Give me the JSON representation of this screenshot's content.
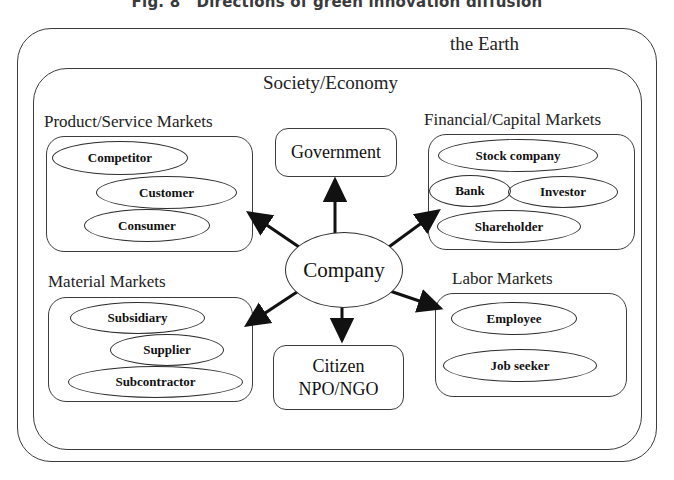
{
  "figure": {
    "caption": "Fig. 8   Directions of green innovation diffusion"
  },
  "frames": {
    "earth_label": "the Earth",
    "society_label": "Society/Economy"
  },
  "center": {
    "label": "Company"
  },
  "nodes": {
    "government": "Government",
    "citizen_line1": "Citizen",
    "citizen_line2": "NPO/NGO"
  },
  "panels": {
    "product_service": {
      "title": "Product/Service Markets",
      "actors": [
        "Competitor",
        "Customer",
        "Consumer"
      ]
    },
    "financial_capital": {
      "title": "Financial/Capital Markets",
      "actors": [
        "Stock company",
        "Bank",
        "Investor",
        "Shareholder"
      ]
    },
    "material": {
      "title": "Material Markets",
      "actors": [
        "Subsidiary",
        "Supplier",
        "Subcontractor"
      ]
    },
    "labor": {
      "title": "Labor Markets",
      "actors": [
        "Employee",
        "Job seeker"
      ]
    }
  },
  "colors": {
    "stroke": "#3c3c3c",
    "text": "#111111",
    "background": "#ffffff"
  }
}
